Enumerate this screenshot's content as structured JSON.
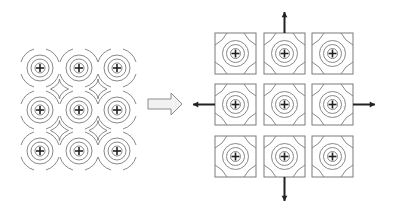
{
  "diagram": {
    "colors": {
      "line": "#7a7a7a",
      "plus": "#222222",
      "arrow": "#222222",
      "transition_arrow_fill": "#f2f2f2",
      "transition_arrow_stroke": "#8a8a8a"
    },
    "left_panel": {
      "label": "overlapping-charge-lattice",
      "rows": 3,
      "cols": 3,
      "centers_x": [
        40,
        79,
        117
      ],
      "centers_y": [
        68,
        110,
        151
      ],
      "ring_radii": [
        5,
        9,
        13,
        17
      ],
      "charge_symbol": "+"
    },
    "transition_arrow": {
      "label": "transforms-to",
      "direction": "right"
    },
    "right_panel": {
      "label": "separated-charge-cells",
      "rows": 3,
      "cols": 3,
      "cell_x": [
        215,
        264,
        312
      ],
      "cell_y": [
        33,
        84,
        136
      ],
      "cell_size": 41,
      "ring_radii": [
        5,
        9,
        13,
        17
      ],
      "charge_symbol": "+",
      "expansion_arrows": [
        "up",
        "down",
        "left",
        "right"
      ]
    }
  }
}
